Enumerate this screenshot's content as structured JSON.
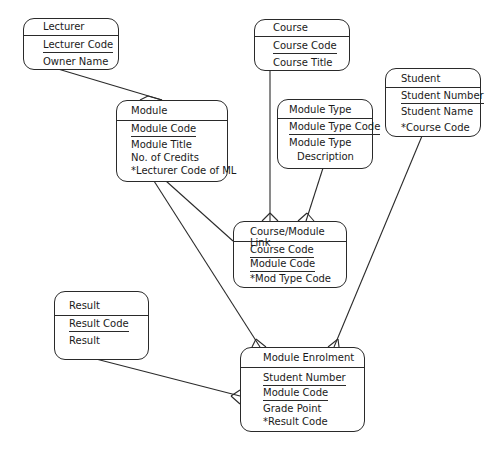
{
  "diagram": {
    "type": "entity-relationship",
    "entities": [
      {
        "id": "lecturer",
        "name": "Lecturer",
        "attributes": [
          {
            "label": "Lecturer Code",
            "key": "primary"
          },
          {
            "label": "Owner Name",
            "key": "none"
          }
        ]
      },
      {
        "id": "course",
        "name": "Course",
        "attributes": [
          {
            "label": "Course Code",
            "key": "primary"
          },
          {
            "label": "Course Title",
            "key": "none"
          }
        ]
      },
      {
        "id": "student",
        "name": "Student",
        "attributes": [
          {
            "label": "Student Number",
            "key": "primary"
          },
          {
            "label": "Student Name",
            "key": "none"
          },
          {
            "label": "*Course Code",
            "key": "foreign"
          }
        ]
      },
      {
        "id": "module_type",
        "name": "Module Type",
        "attributes": [
          {
            "label": "Module Type Code",
            "key": "primary"
          },
          {
            "label": "Module Type",
            "key": "none"
          },
          {
            "label": "Description",
            "key": "none"
          }
        ]
      },
      {
        "id": "module",
        "name": "Module",
        "attributes": [
          {
            "label": "Module Code",
            "key": "primary"
          },
          {
            "label": "Module Title",
            "key": "none"
          },
          {
            "label": "No. of Credits",
            "key": "none"
          },
          {
            "label": "*Lecturer Code of ML",
            "key": "foreign"
          }
        ]
      },
      {
        "id": "course_module_link",
        "name": "Course/Module Link",
        "attributes": [
          {
            "label": "Course Code",
            "key": "primary"
          },
          {
            "label": "Module Code",
            "key": "primary"
          },
          {
            "label": "*Mod Type Code",
            "key": "foreign"
          }
        ]
      },
      {
        "id": "result",
        "name": "Result",
        "attributes": [
          {
            "label": "Result Code",
            "key": "primary"
          },
          {
            "label": "Result",
            "key": "none"
          }
        ]
      },
      {
        "id": "module_enrolment",
        "name": "Module Enrolment",
        "attributes": [
          {
            "label": "Student Number",
            "key": "primary"
          },
          {
            "label": "Module Code",
            "key": "primary"
          },
          {
            "label": "Grade Point",
            "key": "none"
          },
          {
            "label": "*Result Code",
            "key": "foreign"
          }
        ]
      }
    ],
    "relationships": [
      {
        "from": "lecturer",
        "to": "module",
        "cardinality": "one-to-many"
      },
      {
        "from": "course",
        "to": "course_module_link",
        "cardinality": "one-to-many"
      },
      {
        "from": "module_type",
        "to": "course_module_link",
        "cardinality": "one-to-many"
      },
      {
        "from": "module",
        "to": "course_module_link",
        "cardinality": "one-to-many"
      },
      {
        "from": "module",
        "to": "module_enrolment",
        "cardinality": "one-to-many"
      },
      {
        "from": "student",
        "to": "module_enrolment",
        "cardinality": "one-to-many"
      },
      {
        "from": "result",
        "to": "module_enrolment",
        "cardinality": "one-to-many"
      }
    ]
  }
}
